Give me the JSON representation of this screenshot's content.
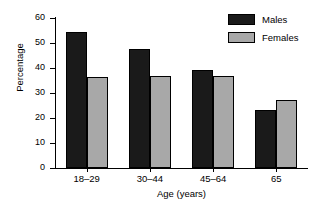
{
  "chart_data": {
    "type": "bar",
    "title": "",
    "subtitle": "",
    "xlabel": "Age (years)",
    "ylabel": "Percentage",
    "categories": [
      "18–29",
      "30–44",
      "45–64",
      "65"
    ],
    "series": [
      {
        "name": "Males",
        "color": "#1a1a1a",
        "values": [
          54.4,
          47.6,
          39.3,
          23.2
        ]
      },
      {
        "name": "Females",
        "color": "#a8a8a8",
        "values": [
          36.4,
          36.8,
          37.0,
          27.2
        ]
      }
    ],
    "ylim": [
      0,
      60
    ],
    "ytick_step": 10,
    "yticks": [
      "0",
      "10",
      "20",
      "30",
      "40",
      "50",
      "60"
    ],
    "grid": false,
    "legend_position": "top-right",
    "annotations": []
  },
  "legend": {
    "entries": [
      {
        "label": "Males"
      },
      {
        "label": "Females"
      }
    ]
  }
}
